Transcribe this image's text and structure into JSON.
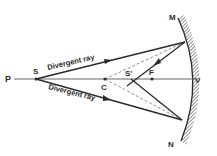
{
  "diagram": {
    "title": "",
    "labels": {
      "P": "P",
      "S": "S",
      "C": "C",
      "S_prime": "S'",
      "F": "F",
      "V": "V",
      "M": "M",
      "N": "N"
    },
    "rays": {
      "upper": "Divergent ray",
      "lower": "Divergent ray"
    },
    "colors": {
      "ink": "#2a2a2a",
      "axis": "#555555",
      "hatch": "#444444"
    }
  }
}
